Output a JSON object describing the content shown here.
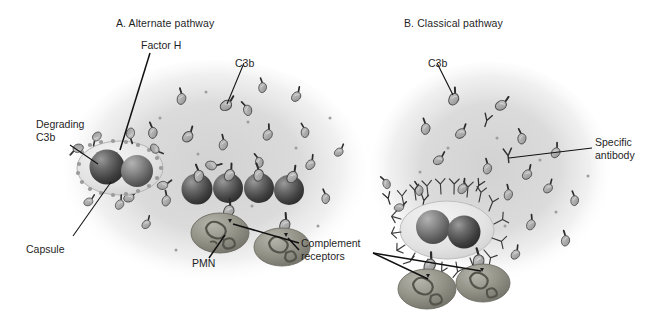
{
  "figure": {
    "title_a": "A. Alternate pathway",
    "title_b": "B. Classical pathway",
    "style": {
      "background": "#ffffff",
      "text_color": "#1f1f1f",
      "field_wash": "#d9d9d9",
      "coccus_dark": "#4a4a4a",
      "coccus_light": "#8c8c8c",
      "capsule_fill": "#ebebeb",
      "pmn_fill": "#8f8e86",
      "line_color": "#111111"
    },
    "labels": {
      "factor_h": "Factor H",
      "c3b_a": "C3b",
      "degrading_c3b": "Degrading\nC3b",
      "capsule": "Capsule",
      "pmn": "PMN",
      "complement_receptors": "Complement\nreceptors",
      "c3b_b": "C3b",
      "specific_antibody": "Specific\nantibody"
    },
    "icon_names": {
      "c3b": "c3b-molecule-icon",
      "antibody": "y-shaped-antibody-icon",
      "coccus": "coccus-sphere-icon",
      "pmn": "pmn-phagocyte-icon",
      "capsule": "bacterial-capsule-icon",
      "field": "tissue-field-wash-icon"
    },
    "panel_a": {
      "name": "alternate-pathway-panel",
      "field": {
        "cx": 215,
        "cy": 170,
        "rx": 150,
        "ry": 110
      },
      "encapsulated_bacterium": {
        "cx": 120,
        "cy": 168,
        "rx": 42,
        "ry": 26
      },
      "free_diplococci": [
        {
          "cx": 196,
          "cy": 188
        },
        {
          "cx": 228,
          "cy": 186
        },
        {
          "cx": 258,
          "cy": 186
        },
        {
          "cx": 289,
          "cy": 184
        }
      ],
      "pmns": [
        {
          "cx": 219,
          "cy": 232,
          "rx": 28,
          "ry": 19
        },
        {
          "cx": 281,
          "cy": 246,
          "rx": 27,
          "ry": 18
        }
      ],
      "c3b_count": 26
    },
    "panel_b": {
      "name": "classical-pathway-panel",
      "field": {
        "cx": 490,
        "cy": 170,
        "rx": 118,
        "ry": 108
      },
      "opsonized_bacterium": {
        "cx": 447,
        "cy": 230,
        "rx": 46,
        "ry": 28
      },
      "pmns": [
        {
          "cx": 427,
          "cy": 288,
          "rx": 28,
          "ry": 19
        },
        {
          "cx": 483,
          "cy": 283,
          "rx": 26,
          "ry": 18
        }
      ],
      "c3b_count": 24,
      "antibody_count": 22
    },
    "leaders": [
      {
        "name": "factor-h-leader",
        "from": [
          150,
          52
        ],
        "to": [
          119,
          149
        ]
      },
      {
        "name": "c3b-a-leader",
        "from": [
          243,
          62
        ],
        "to": [
          226,
          104
        ]
      },
      {
        "name": "degrading-c3b-leader",
        "from": [
          70,
          144
        ],
        "to": [
          97,
          163
        ]
      },
      {
        "name": "capsule-leader",
        "from": [
          72,
          236
        ],
        "to": [
          110,
          181
        ]
      },
      {
        "name": "pmn-leader",
        "from": [
          208,
          258
        ],
        "to": [
          224,
          234
        ]
      },
      {
        "name": "complement-receptors-leader-left",
        "from": [
          300,
          243
        ],
        "to": [
          232,
          224
        ]
      },
      {
        "name": "complement-receptors-leader-right",
        "from": [
          300,
          250
        ],
        "to": [
          279,
          237
        ]
      },
      {
        "name": "c3b-b-leader",
        "from": [
          436,
          62
        ],
        "to": [
          452,
          94
        ]
      },
      {
        "name": "specific-antibody-leader",
        "from": [
          593,
          148
        ],
        "to": [
          508,
          160
        ]
      },
      {
        "name": "cr-b-leader-left",
        "from": [
          372,
          253
        ],
        "to": [
          428,
          281
        ]
      },
      {
        "name": "cr-b-leader-right",
        "from": [
          372,
          253
        ],
        "to": [
          481,
          274
        ]
      }
    ]
  }
}
